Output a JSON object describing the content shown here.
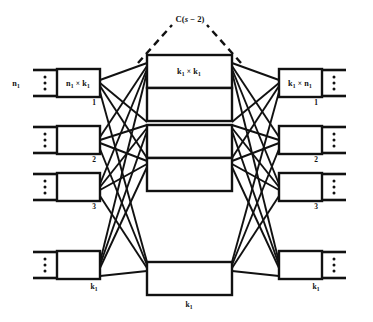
{
  "figure": {
    "name": "three-stage-clos-network",
    "top_label": {
      "main": "C(",
      "var": "s",
      "op": " − ",
      "num": "2",
      "close": ")",
      "full": "C(s − 2)"
    },
    "colors": {
      "ink": "#111111",
      "paper": "#ffffff"
    },
    "input_stage": {
      "outer_label": "n",
      "outer_label_sub": "1",
      "box_label_a": "n",
      "box_label_a_sub": "1",
      "box_label_op": " × ",
      "box_label_b": "k",
      "box_label_b_sub": "1",
      "box_label_full": "n₁ × k₁",
      "bottom_label": "k",
      "bottom_label_sub": "1",
      "indices": [
        "1",
        "2",
        "3",
        ""
      ],
      "rows": [
        {
          "index": "1",
          "label": "n₁ × k₁",
          "show_label": true
        },
        {
          "index": "2",
          "label": "",
          "show_label": false
        },
        {
          "index": "3",
          "label": "",
          "show_label": false
        },
        {
          "index": "",
          "label": "",
          "show_label": false
        }
      ]
    },
    "middle_stage": {
      "box_label_a": "k",
      "box_label_a_sub": "1",
      "box_label_op": " × ",
      "box_label_b": "k",
      "box_label_b_sub": "1",
      "box_label_full": "k₁ × k₁",
      "bottom_label": "k",
      "bottom_label_sub": "1",
      "indices": [
        "1",
        "2",
        "3",
        ""
      ],
      "rows": [
        {
          "index": "1",
          "label": "k₁ × k₁",
          "show_label": true
        },
        {
          "index": "2",
          "label": "",
          "show_label": false
        },
        {
          "index": "3",
          "label": "",
          "show_label": false
        },
        {
          "index": "",
          "label": "",
          "show_label": false
        }
      ]
    },
    "output_stage": {
      "outer_label": "n",
      "outer_label_sub": "1",
      "box_label_a": "k",
      "box_label_a_sub": "1",
      "box_label_op": " × ",
      "box_label_b": "n",
      "box_label_b_sub": "1",
      "box_label_full": "k₁ × n₁",
      "bottom_label": "k",
      "bottom_label_sub": "1",
      "indices": [
        "1",
        "2",
        "3",
        ""
      ],
      "rows": [
        {
          "index": "1",
          "label": "k₁ × n₁",
          "show_label": true
        },
        {
          "index": "2",
          "label": "",
          "show_label": false
        },
        {
          "index": "3",
          "label": "",
          "show_label": false
        },
        {
          "index": "",
          "label": "",
          "show_label": false
        }
      ]
    }
  }
}
